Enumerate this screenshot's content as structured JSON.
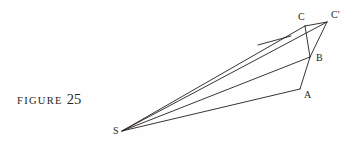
{
  "page": {
    "background_color": "#fefefe",
    "ink_color": "#241f1c",
    "width": 355,
    "height": 146
  },
  "caption": {
    "word": "FIGURE",
    "number": "25",
    "full_text": "FIGURE 25"
  },
  "diagram": {
    "vertices": [
      {
        "name": "S",
        "label": "S",
        "x": 122,
        "y": 131,
        "label_x": 113,
        "label_y": 134
      },
      {
        "name": "A",
        "label": "A",
        "x": 300,
        "y": 89,
        "label_x": 304,
        "label_y": 98
      },
      {
        "name": "B",
        "label": "B",
        "x": 310,
        "y": 57,
        "label_x": 316,
        "label_y": 61
      },
      {
        "name": "C",
        "label": "C",
        "x": 305,
        "y": 26,
        "label_x": 298,
        "label_y": 20
      },
      {
        "name": "Cp",
        "label": "C'",
        "x": 327,
        "y": 22,
        "label_x": 331,
        "label_y": 18
      }
    ],
    "edges": [
      {
        "name": "ray-S-A",
        "from": "S",
        "to": "A"
      },
      {
        "name": "ray-S-B",
        "from": "S",
        "to": "B"
      },
      {
        "name": "ray-S-C",
        "from": "S",
        "to": "C"
      },
      {
        "name": "ray-S-Cp",
        "from": "S",
        "to": "Cp"
      },
      {
        "name": "segment-A-B",
        "from": "A",
        "to": "B"
      },
      {
        "name": "segment-B-C",
        "from": "B",
        "to": "C"
      },
      {
        "name": "segment-B-Cp",
        "from": "B",
        "to": "Cp"
      },
      {
        "name": "segment-C-Cp",
        "from": "C",
        "to": "Cp"
      }
    ],
    "tick_segment": {
      "name": "parallel-tick-mark",
      "x1": 258,
      "y1": 45,
      "x2": 291,
      "y2": 36
    },
    "stroke_width": 0.9
  }
}
